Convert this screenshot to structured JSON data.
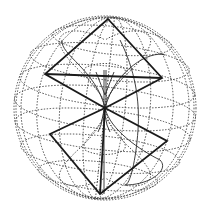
{
  "figure": {
    "colors": {
      "background": "#ffffff",
      "ink": "#1a1a1a",
      "grid": "#3a3a3a"
    },
    "sphere": {
      "cx": 105,
      "cy": 108,
      "rx": 91,
      "ry": 92
    },
    "upper_square": [
      [
        108,
        19
      ],
      [
        162,
        78
      ],
      [
        105,
        108
      ],
      [
        45,
        74
      ]
    ],
    "lower_square": [
      [
        105,
        108
      ],
      [
        167,
        141
      ],
      [
        100,
        194
      ],
      [
        50,
        134
      ]
    ],
    "center_point": [
      105,
      108
    ]
  }
}
